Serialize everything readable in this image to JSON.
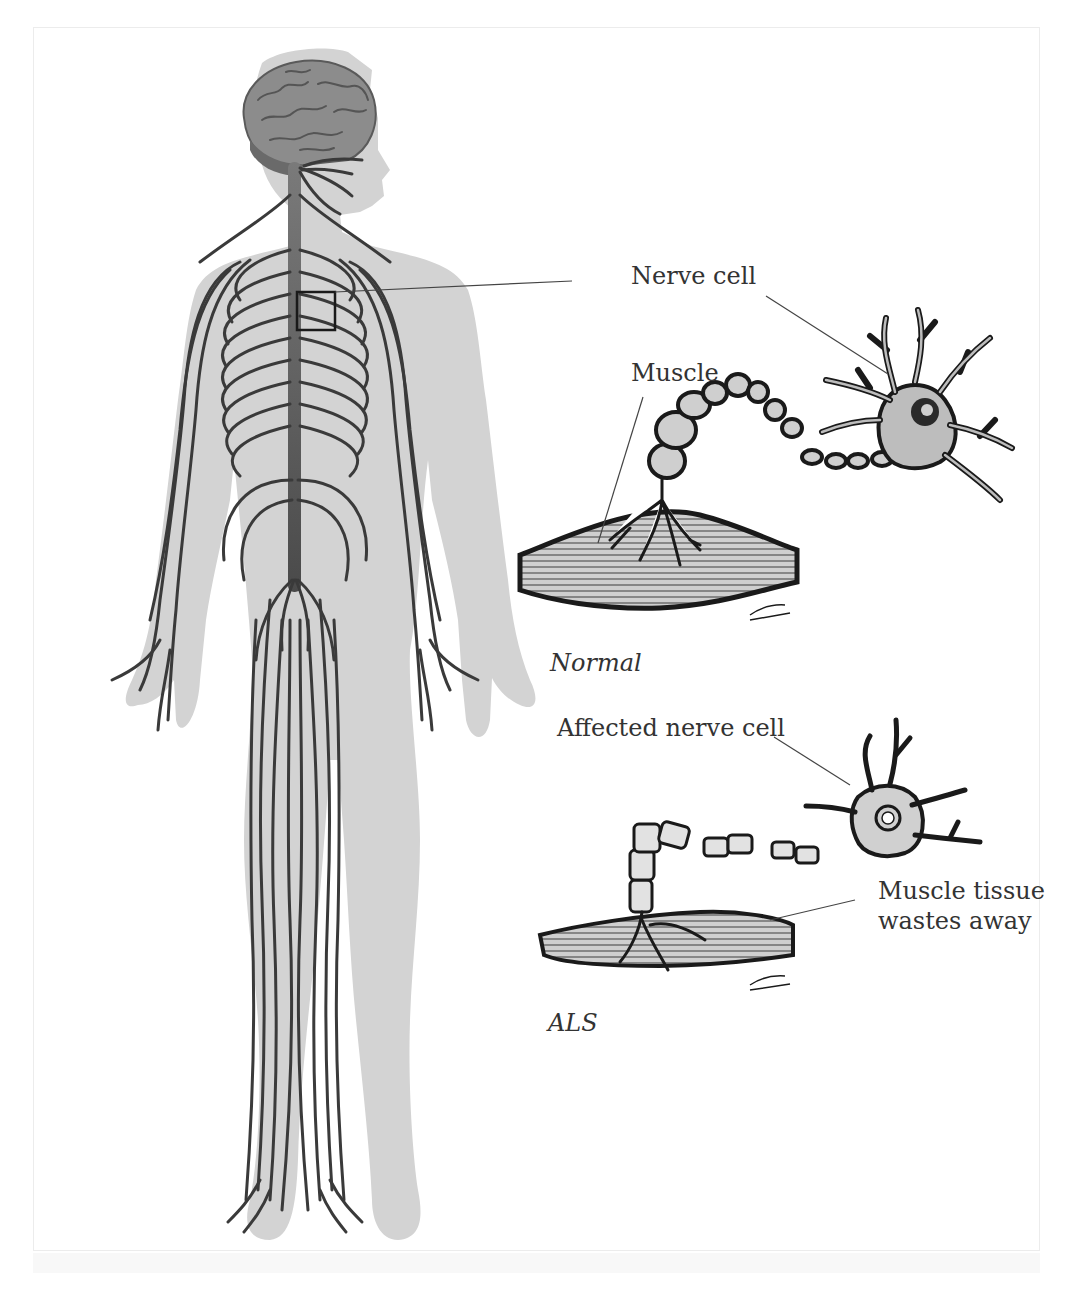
{
  "figure": {
    "colors": {
      "body_silhouette": "#d3d3d3",
      "nerves": "#3a3a3a",
      "brain": "#8c8c8c",
      "spinal_cord": "#6e6e6e",
      "ink": "#222222",
      "label_text": "#333333"
    }
  },
  "labels": {
    "nerve_cell": "Nerve cell",
    "muscle": "Muscle",
    "normal": "Normal",
    "affected_nerve_cell": "Affected nerve cell",
    "muscle_tissue_line1": "Muscle tissue",
    "muscle_tissue_line2": "wastes away",
    "als": "ALS"
  },
  "panels": [
    {
      "id": "normal",
      "caption": "Normal",
      "callouts": [
        "Nerve cell",
        "Muscle"
      ]
    },
    {
      "id": "als",
      "caption": "ALS",
      "callouts": [
        "Affected nerve cell",
        "Muscle tissue wastes away"
      ]
    }
  ],
  "signature": "Ariani"
}
